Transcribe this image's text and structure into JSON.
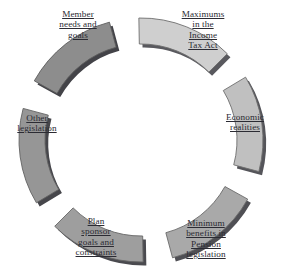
{
  "diagram": {
    "type": "circular-segment-wheel",
    "background_color": "#ffffff",
    "center": {
      "x": 141,
      "y": 140
    },
    "segments": [
      {
        "id": "maximums-income-tax-act",
        "label_lines": [
          "Maximums",
          "in the",
          "Income",
          "Tax Act"
        ],
        "position": "top",
        "angle_deg": -68,
        "fill_color": "#cfcfcf",
        "stroke_color": "#6e6e6e",
        "shadow_color": "#59595e"
      },
      {
        "id": "economic-realities",
        "label_lines": [
          "Economic",
          "realities"
        ],
        "position": "upper-right",
        "angle_deg": -8,
        "fill_color": "#c0c0c0",
        "stroke_color": "#6e6e6e",
        "shadow_color": "#55555a"
      },
      {
        "id": "minimum-benefits-pension-legislation",
        "label_lines": [
          "Minimum",
          "benefits in",
          "Pension",
          "legislation"
        ],
        "position": "lower-right",
        "angle_deg": 52,
        "fill_color": "#a9a9a9",
        "stroke_color": "#6a6a6a",
        "shadow_color": "#4f4f54"
      },
      {
        "id": "plan-sponsor-goals-and-constraints",
        "label_lines": [
          "Plan",
          "sponsor",
          "goals and",
          "constraints"
        ],
        "position": "bottom",
        "angle_deg": 112,
        "fill_color": "#9e9e9e",
        "stroke_color": "#676767",
        "shadow_color": "#4a4a4f"
      },
      {
        "id": "other-legislation",
        "label_lines": [
          "Other",
          "legislation"
        ],
        "position": "lower-left",
        "angle_deg": 172,
        "fill_color": "#969696",
        "stroke_color": "#626262",
        "shadow_color": "#46464b"
      },
      {
        "id": "member-needs-and-goals",
        "label_lines": [
          "Member",
          "needs and",
          "goals"
        ],
        "position": "upper-left",
        "angle_deg": 232,
        "fill_color": "#8d8d8d",
        "stroke_color": "#5e5e5e",
        "shadow_color": "#434348"
      }
    ]
  }
}
